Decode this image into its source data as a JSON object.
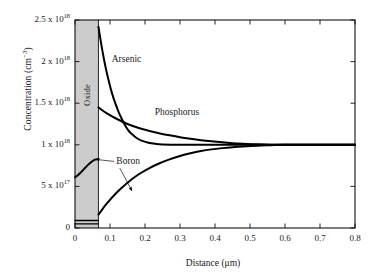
{
  "chart_data": {
    "type": "line",
    "title": "",
    "xlabel": "Distance (μm)",
    "ylabel": "Concentration (cm⁻³)",
    "xlim": [
      0,
      0.8
    ],
    "ylim": [
      0,
      2500000000000000000
    ],
    "grid": false,
    "legend_position": "inline-annotations",
    "xticks": [
      "0",
      "0.1",
      "0.2",
      "0.3",
      "0.4",
      "0.5",
      "0.6",
      "0.7",
      "0.8"
    ],
    "xtick_values": [
      0,
      0.1,
      0.2,
      0.3,
      0.4,
      0.5,
      0.6,
      0.7,
      0.8
    ],
    "yticks": [
      {
        "value": 0,
        "mantissa": "0",
        "exponent": ""
      },
      {
        "value": 5e+17,
        "mantissa": "5 x 10",
        "exponent": "17"
      },
      {
        "value": 1e+18,
        "mantissa": "1 x 10",
        "exponent": "18"
      },
      {
        "value": 1.5e+18,
        "mantissa": "1.5 x 10",
        "exponent": "18"
      },
      {
        "value": 2e+18,
        "mantissa": "2 x 10",
        "exponent": "18"
      },
      {
        "value": 2.5e+18,
        "mantissa": "2.5 x 10",
        "exponent": "18"
      }
    ],
    "regions": [
      {
        "name": "Oxide",
        "label": "Oxide",
        "x_start": 0,
        "x_end": 0.067,
        "fill": "#cccccc"
      }
    ],
    "annotations": [
      {
        "text": "Arsenic",
        "x": 0.105,
        "y": 2.02e+18
      },
      {
        "text": "Phosphorus",
        "x": 0.228,
        "y": 1.38e+18
      },
      {
        "text": "Boron",
        "x": 0.118,
        "y": 7.9e+17
      }
    ],
    "series": [
      {
        "name": "Arsenic",
        "color": "#000000",
        "x": [
          0.067,
          0.075,
          0.085,
          0.095,
          0.105,
          0.115,
          0.125,
          0.135,
          0.145,
          0.155,
          0.165,
          0.175,
          0.19,
          0.21,
          0.23,
          0.25,
          0.3,
          0.4,
          0.5,
          0.6,
          0.7,
          0.8
        ],
        "y": [
          2.42e+18,
          2.21e+18,
          1.98e+18,
          1.79e+18,
          1.63e+18,
          1.5e+18,
          1.39e+18,
          1.3e+18,
          1.22e+18,
          1.16e+18,
          1.12e+18,
          1.085e+18,
          1.05e+18,
          1.025e+18,
          1.012e+18,
          1.005e+18,
          1e+18,
          1e+18,
          1e+18,
          1e+18,
          1e+18,
          1e+18
        ]
      },
      {
        "name": "Phosphorus",
        "color": "#000000",
        "x": [
          0.067,
          0.09,
          0.12,
          0.15,
          0.18,
          0.21,
          0.24,
          0.27,
          0.3,
          0.33,
          0.36,
          0.39,
          0.42,
          0.45,
          0.48,
          0.52,
          0.56,
          0.6,
          0.7,
          0.8
        ],
        "y": [
          1.45e+18,
          1.38e+18,
          1.31e+18,
          1.25e+18,
          1.205e+18,
          1.17e+18,
          1.14e+18,
          1.115e+18,
          1.092e+18,
          1.073e+18,
          1.056e+18,
          1.042e+18,
          1.03e+18,
          1.02e+18,
          1.013e+18,
          1.006e+18,
          1.002e+18,
          1e+18,
          1e+18,
          1e+18
        ]
      },
      {
        "name": "Boron",
        "color": "#000000",
        "x": [
          0.067,
          0.09,
          0.12,
          0.15,
          0.18,
          0.21,
          0.24,
          0.27,
          0.3,
          0.33,
          0.36,
          0.39,
          0.42,
          0.45,
          0.48,
          0.52,
          0.56,
          0.6,
          0.7,
          0.8
        ],
        "y": [
          1.6e+17,
          2.9e+17,
          4.3e+17,
          5.45e+17,
          6.4e+17,
          7.15e+17,
          7.75e+17,
          8.25e+17,
          8.65e+17,
          8.98e+17,
          9.25e+17,
          9.45e+17,
          9.6e+17,
          9.72e+17,
          9.81e+17,
          9.9e+17,
          9.95e+17,
          1e+18,
          1e+18,
          1e+18
        ]
      },
      {
        "name": "Boron-in-oxide",
        "color": "#000000",
        "x": [
          0.0,
          0.008,
          0.017,
          0.026,
          0.035,
          0.044,
          0.052,
          0.06,
          0.067
        ],
        "y": [
          6.1e+17,
          6.35e+17,
          6.7e+17,
          7.1e+17,
          7.5e+17,
          7.85e+17,
          8.1e+17,
          8.25e+17,
          8.3e+17
        ]
      },
      {
        "name": "oxide-interface-line-upper",
        "color": "#000000",
        "x": [
          0.0,
          0.067
        ],
        "y": [
          9e+16,
          9e+16
        ]
      },
      {
        "name": "oxide-interface-line-lower",
        "color": "#000000",
        "x": [
          0.0,
          0.067
        ],
        "y": [
          5e+16,
          5e+16
        ]
      }
    ]
  },
  "axes": {
    "left": 75,
    "right": 355,
    "top": 20,
    "bottom": 228
  }
}
